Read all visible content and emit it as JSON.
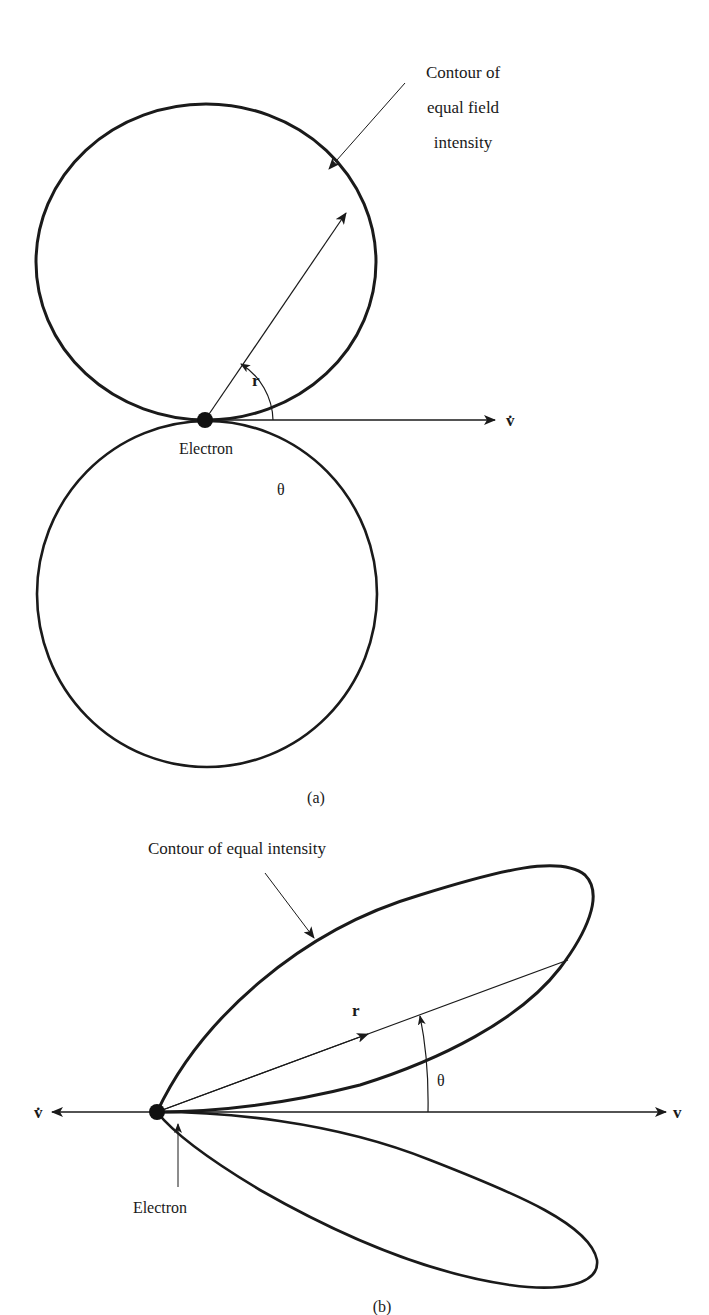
{
  "figure_a": {
    "caption": "(a)",
    "contour_label_lines": [
      "Contour of",
      "equal field",
      "intensity"
    ],
    "radius_label": "r",
    "angle_label": "θ",
    "axis_label": "v̇",
    "electron_label": "Electron"
  },
  "figure_b": {
    "caption": "(b)",
    "contour_label": "Contour of equal intensity",
    "radius_label": "r",
    "angle_label": "θ",
    "left_axis_label": "v̇",
    "right_axis_label": "v",
    "electron_label": "Electron"
  },
  "colors": {
    "ink": "#1a1a1a",
    "background": "#ffffff"
  }
}
